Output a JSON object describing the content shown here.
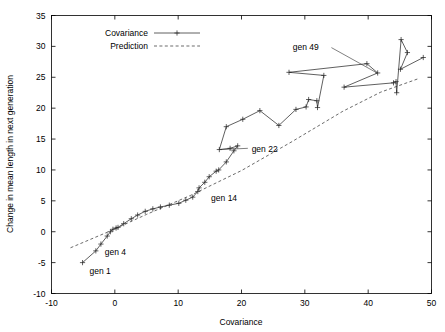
{
  "chart_data": {
    "type": "line",
    "title": "",
    "xlabel": "Covariance",
    "ylabel": "Change in mean length in next generation",
    "xlim": [
      -10,
      50
    ],
    "ylim": [
      -10,
      35
    ],
    "xticks": [
      -10,
      0,
      10,
      20,
      30,
      40,
      50
    ],
    "yticks": [
      -10,
      -5,
      0,
      5,
      10,
      15,
      20,
      25,
      30,
      35
    ],
    "xtick_labels": [
      "-10",
      "0",
      "10",
      "20",
      "30",
      "40",
      "50"
    ],
    "ytick_labels": [
      "-10",
      "-5",
      "0",
      "5",
      "10",
      "15",
      "20",
      "25",
      "30",
      "35"
    ],
    "grid": false,
    "legend_position": "top-left-inside",
    "series": [
      {
        "name": "Covariance",
        "style": "solid-with-cross-markers",
        "color": "#2b2b2b",
        "points": [
          [
            -5.1,
            -5.0
          ],
          [
            -3.0,
            -3.1
          ],
          [
            -2.2,
            -2.0
          ],
          [
            -1.2,
            -0.7
          ],
          [
            -0.7,
            0.0
          ],
          [
            -0.3,
            0.4
          ],
          [
            0.2,
            0.6
          ],
          [
            0.5,
            0.7
          ],
          [
            1.4,
            1.3
          ],
          [
            2.6,
            2.1
          ],
          [
            3.6,
            2.7
          ],
          [
            4.8,
            3.3
          ],
          [
            6.0,
            3.7
          ],
          [
            7.2,
            4.0
          ],
          [
            8.6,
            4.3
          ],
          [
            10.1,
            4.6
          ],
          [
            11.2,
            5.1
          ],
          [
            12.3,
            5.6
          ],
          [
            13.1,
            6.5
          ],
          [
            13.3,
            7.1
          ],
          [
            14.2,
            8.0
          ],
          [
            14.9,
            8.9
          ],
          [
            16.0,
            9.8
          ],
          [
            16.4,
            10.0
          ],
          [
            17.6,
            11.3
          ],
          [
            18.8,
            13.1
          ],
          [
            19.4,
            13.9
          ],
          [
            18.2,
            13.5
          ],
          [
            16.5,
            13.3
          ],
          [
            17.6,
            17.0
          ],
          [
            20.2,
            18.2
          ],
          [
            22.9,
            19.6
          ],
          [
            25.9,
            17.2
          ],
          [
            28.6,
            19.8
          ],
          [
            30.2,
            20.2
          ],
          [
            30.6,
            21.4
          ],
          [
            31.9,
            21.2
          ],
          [
            32.0,
            20.1
          ],
          [
            33.0,
            25.3
          ],
          [
            27.5,
            25.8
          ],
          [
            39.8,
            27.2
          ],
          [
            41.5,
            25.7
          ],
          [
            36.2,
            23.4
          ],
          [
            44.0,
            24.1
          ],
          [
            44.4,
            24.3
          ],
          [
            44.5,
            22.5
          ],
          [
            45.2,
            31.1
          ],
          [
            46.2,
            29.0
          ],
          [
            45.1,
            26.3
          ],
          [
            48.7,
            28.2
          ]
        ]
      },
      {
        "name": "Prediction",
        "style": "dashed",
        "color": "#2b2b2b",
        "points": [
          [
            -7.0,
            -2.6
          ],
          [
            -1.0,
            0.0
          ],
          [
            5.0,
            2.8
          ],
          [
            12.0,
            5.9
          ],
          [
            20.0,
            9.9
          ],
          [
            28.0,
            14.6
          ],
          [
            36.0,
            19.5
          ],
          [
            42.0,
            22.6
          ],
          [
            48.0,
            24.8
          ]
        ]
      }
    ],
    "annotations": [
      {
        "text": "gen 1",
        "x": -4.0,
        "y": -6.3,
        "anchor": "start",
        "leader": null
      },
      {
        "text": "gen 4",
        "x": -1.6,
        "y": -3.3,
        "anchor": "start",
        "leader": null
      },
      {
        "text": "gen 14",
        "x": 15.2,
        "y": 5.4,
        "anchor": "start",
        "leader": null
      },
      {
        "text": "gen 22",
        "x": 21.6,
        "y": 13.4,
        "anchor": "start",
        "leader": {
          "x1": 21.0,
          "y1": 13.5,
          "x2": 16.7,
          "y2": 13.3
        }
      },
      {
        "text": "gen 49",
        "x": 28.1,
        "y": 29.9,
        "anchor": "start",
        "leader": {
          "x1": 34.2,
          "y1": 29.8,
          "x2": 41.4,
          "y2": 25.7
        }
      }
    ],
    "legend": [
      {
        "label": "Covariance",
        "style": "solid-with-cross-markers"
      },
      {
        "label": "Prediction",
        "style": "dashed"
      }
    ]
  }
}
